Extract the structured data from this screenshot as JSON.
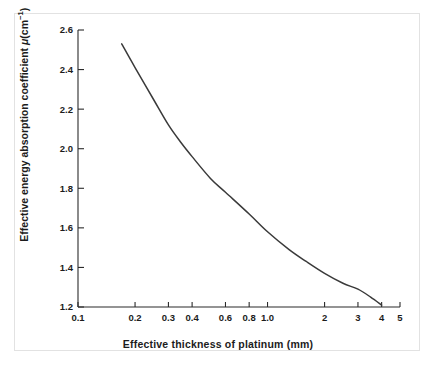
{
  "figure": {
    "background": "#ffffff",
    "border_color": "#e2e2e2",
    "axis_color": "#2b2b2b",
    "curve_color": "#3a3a3a"
  },
  "axes": {
    "xlabel": "Effective thickness of platinum (mm)",
    "ylabel_prefix": "Effective energy absorption coefficient",
    "ylabel_symbol": "μ",
    "ylabel_unit_base": "(cm",
    "ylabel_unit_exp": "−1",
    "ylabel_unit_close": ")",
    "x_ticks": [
      "0.1",
      "0.2",
      "0.3",
      "0.4",
      "0.6",
      "0.8",
      "1.0",
      "2",
      "3",
      "4",
      "5"
    ],
    "y_ticks": [
      "1.2",
      "1.4",
      "1.6",
      "1.8",
      "2.0",
      "2.2",
      "2.4",
      "2.6"
    ]
  },
  "chart_data": {
    "type": "line",
    "title": "",
    "subtitle": "",
    "xlabel": "Effective thickness of platinum (mm)",
    "ylabel": "Effective energy absorption coefficient μ(cm⁻¹)",
    "xscale": "log",
    "yscale": "linear",
    "xlim": [
      0.1,
      5
    ],
    "ylim": [
      1.2,
      2.6
    ],
    "grid": false,
    "legend": null,
    "x_tick_values": [
      0.1,
      0.2,
      0.3,
      0.4,
      0.6,
      0.8,
      1.0,
      2,
      3,
      4,
      5
    ],
    "x_tick_labels": [
      "0.1",
      "0.2",
      "0.3",
      "0.4",
      "0.6",
      "0.8",
      "1.0",
      "2",
      "3",
      "4",
      "5"
    ],
    "y_tick_values": [
      1.2,
      1.4,
      1.6,
      1.8,
      2.0,
      2.2,
      2.4,
      2.6
    ],
    "y_tick_labels": [
      "1.2",
      "1.4",
      "1.6",
      "1.8",
      "2.0",
      "2.2",
      "2.4",
      "2.6"
    ],
    "series": [
      {
        "name": "Effective energy absorption coefficient of platinum",
        "x": [
          0.17,
          0.2,
          0.25,
          0.3,
          0.35,
          0.4,
          0.5,
          0.6,
          0.8,
          1.0,
          1.3,
          1.6,
          2.0,
          2.5,
          3.0,
          3.5,
          4.0
        ],
        "y": [
          2.53,
          2.41,
          2.25,
          2.12,
          2.03,
          1.96,
          1.85,
          1.78,
          1.67,
          1.58,
          1.49,
          1.43,
          1.37,
          1.32,
          1.29,
          1.25,
          1.21
        ]
      }
    ]
  }
}
